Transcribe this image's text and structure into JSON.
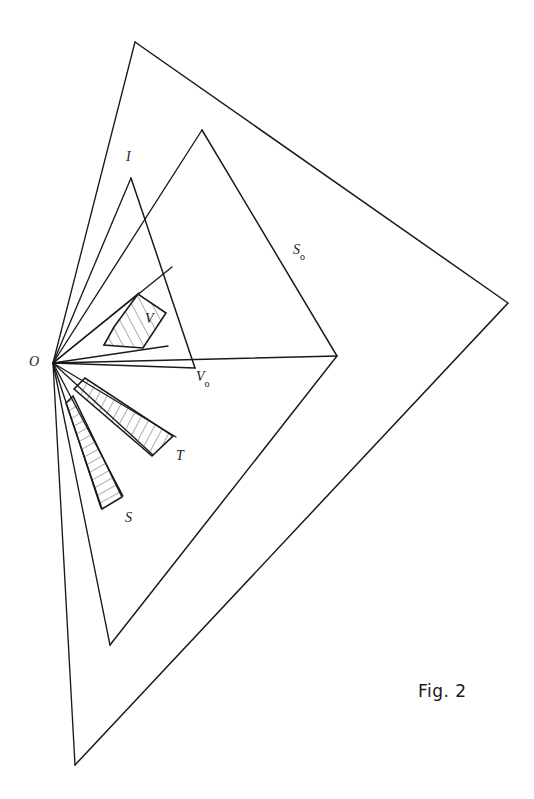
{
  "figure": {
    "caption": "Fig. 2",
    "caption_position": {
      "x": 418,
      "y": 681
    },
    "background_color": "#ffffff",
    "stroke_color": "#1a1a1a",
    "hatch_color": "#4a4a4a",
    "origin": {
      "label": "O",
      "x": 53,
      "y": 363
    },
    "labels": [
      {
        "name": "label-O",
        "text": "O",
        "sub": "",
        "x": 29,
        "y": 355
      },
      {
        "name": "label-I",
        "text": "I",
        "sub": "",
        "x": 126,
        "y": 150
      },
      {
        "name": "label-S0",
        "text": "S",
        "sub": "o",
        "x": 293,
        "y": 243
      },
      {
        "name": "label-V",
        "text": "V",
        "sub": "",
        "x": 145,
        "y": 312
      },
      {
        "name": "label-V0",
        "text": "V",
        "sub": "o",
        "x": 196,
        "y": 370
      },
      {
        "name": "label-T",
        "text": "T",
        "sub": "",
        "x": 176,
        "y": 449
      },
      {
        "name": "label-S",
        "text": "S",
        "sub": "",
        "x": 125,
        "y": 511
      }
    ],
    "chevrons": [
      {
        "name": "chevron-S0-outer",
        "points": "135,42 508,303 75,765"
      },
      {
        "name": "chevron-S0-inner",
        "points": "202,130 337,356 110,645"
      },
      {
        "name": "chevron-I-V0",
        "points": "131,178 195,368"
      }
    ],
    "rays": [
      {
        "name": "ray-to-outer-apex",
        "x2": 135,
        "y2": 42
      },
      {
        "name": "ray-to-mid-apex",
        "x2": 202,
        "y2": 130
      },
      {
        "name": "ray-to-I-apex",
        "x2": 131,
        "y2": 178
      },
      {
        "name": "ray-I-lower",
        "x2": 172,
        "y2": 267
      },
      {
        "name": "ray-V-upper",
        "x2": 139,
        "y2": 293
      },
      {
        "name": "ray-V-lower",
        "x2": 168,
        "y2": 346
      },
      {
        "name": "ray-V0-upper",
        "x2": 337,
        "y2": 356
      },
      {
        "name": "ray-V0-apex",
        "x2": 195,
        "y2": 368
      },
      {
        "name": "ray-T-upper",
        "x2": 176,
        "y2": 437
      },
      {
        "name": "ray-T-lower",
        "x2": 153,
        "y2": 455
      },
      {
        "name": "ray-S-upper",
        "x2": 123,
        "y2": 496
      },
      {
        "name": "ray-S-lower",
        "x2": 101,
        "y2": 508
      },
      {
        "name": "ray-lower-inner",
        "x2": 110,
        "y2": 645
      },
      {
        "name": "ray-lower-outer",
        "x2": 75,
        "y2": 765
      }
    ],
    "sectors": [
      {
        "name": "sector-V",
        "label": "V",
        "hatched": true,
        "points": "104,345 114,327 138,294 166,313 143,348",
        "hatch_count": 9
      },
      {
        "name": "sector-T",
        "label": "T",
        "hatched": true,
        "points": "74,389 85,378 173,436 152,456",
        "hatch_count": 12
      },
      {
        "name": "sector-S",
        "label": "S",
        "hatched": true,
        "points": "66,403 73,396 122,497 102,509",
        "hatch_count": 11
      }
    ]
  }
}
